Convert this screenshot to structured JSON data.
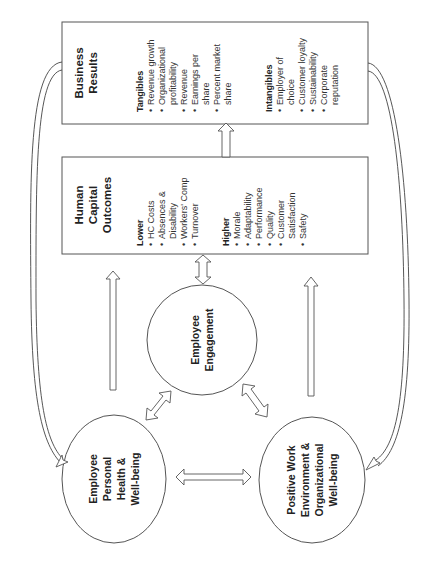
{
  "diagram": {
    "business_results": {
      "title_lines": [
        "Business",
        "Results"
      ],
      "groups": [
        {
          "heading": "Tangibles",
          "items": [
            {
              "lines": [
                "Revenue growth"
              ]
            },
            {
              "lines": [
                "Organizational",
                "profitability"
              ]
            },
            {
              "lines": [
                "Revenue"
              ]
            },
            {
              "lines": [
                "Earnings per",
                "share"
              ]
            },
            {
              "lines": [
                "Percent market",
                "share"
              ]
            }
          ]
        },
        {
          "heading": "Intangibles",
          "items": [
            {
              "lines": [
                "Employer of",
                "choice"
              ]
            },
            {
              "lines": [
                "Customer loyalty"
              ]
            },
            {
              "lines": [
                "Sustainability"
              ]
            },
            {
              "lines": [
                "Corporate",
                "reputation"
              ]
            }
          ]
        }
      ]
    },
    "human_capital_outcomes": {
      "title_lines": [
        "Human",
        "Capital",
        "Outcomes"
      ],
      "groups": [
        {
          "heading": "Lower",
          "items": [
            {
              "lines": [
                "HC Costs"
              ]
            },
            {
              "lines": [
                "Absences &",
                "Disability"
              ]
            },
            {
              "lines": [
                "Workers' Comp"
              ]
            },
            {
              "lines": [
                "Turnover"
              ]
            }
          ]
        },
        {
          "heading": "Higher",
          "items": [
            {
              "lines": [
                "Morale"
              ]
            },
            {
              "lines": [
                "Adaptability"
              ]
            },
            {
              "lines": [
                "Performance"
              ]
            },
            {
              "lines": [
                "Quality"
              ]
            },
            {
              "lines": [
                "Customer",
                "Satisfaction"
              ]
            },
            {
              "lines": [
                "Safety"
              ]
            }
          ]
        }
      ]
    },
    "nodes": {
      "engagement": {
        "lines": [
          "Employee",
          "Engagement"
        ]
      },
      "health": {
        "lines": [
          "Employee",
          "Personal",
          "Health &",
          "Well-being"
        ]
      },
      "work_env": {
        "lines": [
          "Positive Work",
          "Environment &",
          "Organizational",
          "Well-being"
        ]
      }
    },
    "bullet": "•"
  }
}
